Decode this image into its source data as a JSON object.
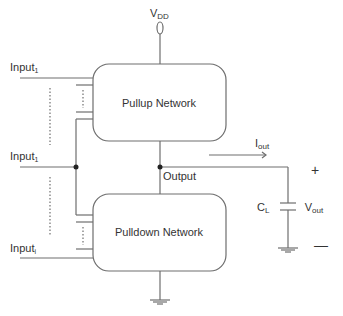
{
  "diagram": {
    "supply": {
      "label": "V",
      "sub": "DD"
    },
    "pullup": {
      "label": "Pullup Network"
    },
    "pulldown": {
      "label": "Pulldown Network"
    },
    "inputs": [
      {
        "label": "Input",
        "sub": "1"
      },
      {
        "label": "Input",
        "sub": "1"
      },
      {
        "label": "Input",
        "sub": "i"
      }
    ],
    "output": {
      "label": "Output"
    },
    "current": {
      "label": "I",
      "sub": "out"
    },
    "load": {
      "label": "C",
      "sub": "L"
    },
    "vout": {
      "label": "V",
      "sub": "out",
      "plus": "+",
      "minus": "—"
    }
  },
  "colors": {
    "line": "#6e6e6e",
    "text": "#333333",
    "background": "#ffffff"
  }
}
